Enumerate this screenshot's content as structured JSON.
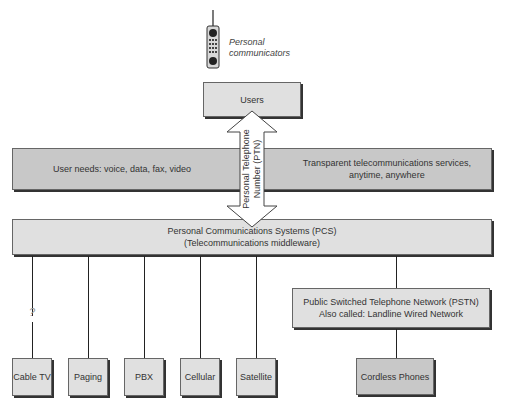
{
  "device": {
    "icon": "cell-phone-icon",
    "caption_line1": "Personal",
    "caption_line2": "communicators"
  },
  "users_box": {
    "label": "Users"
  },
  "needs_band": {
    "left_text": "User needs:  voice, data, fax, video",
    "right_line1": "Transparent telecommunications services,",
    "right_line2": "anytime, anywhere"
  },
  "ptn_arrow": {
    "line1": "Personal Telephone",
    "line2": "Number (PTN)"
  },
  "pcs_box": {
    "line1": "Personal Communications Systems (PCS)",
    "line2": "(Telecommunications middleware)"
  },
  "unknown_link_mark": "?",
  "networks": [
    {
      "label": "Cable TV"
    },
    {
      "label": "Paging"
    },
    {
      "label": "PBX"
    },
    {
      "label": "Cellular"
    },
    {
      "label": "Satellite"
    }
  ],
  "pstn_box": {
    "line1": "Public Switched Telephone Network (PSTN)",
    "line2": "Also called:  Landline Wired Network"
  },
  "cordless_box": {
    "label": "Cordless Phones"
  },
  "colors": {
    "box_fill": "#e0e0e0",
    "band_fill": "#c8c8c8",
    "border": "#666666",
    "shadow": "#333333",
    "arrow_fill": "#ffffff"
  }
}
